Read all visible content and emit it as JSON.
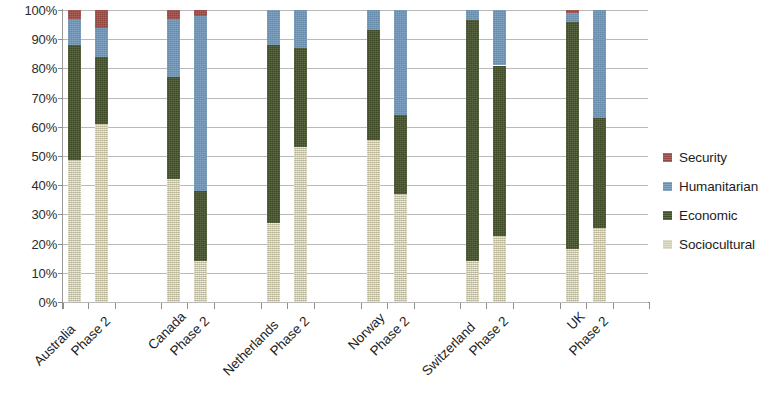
{
  "chart_data": {
    "type": "bar",
    "title": "",
    "subtitle": "",
    "xlabel": "",
    "ylabel": "",
    "stacked": true,
    "stack_mode": "percent",
    "grid": true,
    "legend_position": "right",
    "ylim": [
      0,
      100
    ],
    "ytick_labels": [
      "0%",
      "10%",
      "20%",
      "30%",
      "40%",
      "50%",
      "60%",
      "70%",
      "80%",
      "90%",
      "100%"
    ],
    "ytick_values": [
      0,
      10,
      20,
      30,
      40,
      50,
      60,
      70,
      80,
      90,
      100
    ],
    "categories": [
      "Australia",
      "Phase 2",
      "Canada",
      "Phase 2",
      "Netherlands",
      "Phase 2",
      "Norway",
      "Phase 2",
      "Switzerland",
      "Phase 2",
      "UK",
      "Phase 2"
    ],
    "groups": [
      "Australia",
      "Canada",
      "Netherlands",
      "Norway",
      "Switzerland",
      "UK"
    ],
    "series": [
      {
        "name": "Sociocultural",
        "color": "#d9d8c0",
        "values": [
          48.5,
          61.0,
          42.0,
          14.0,
          27.0,
          53.0,
          55.5,
          37.0,
          14.0,
          22.5,
          18.0,
          25.5
        ]
      },
      {
        "name": "Economic",
        "color": "#44512a",
        "values": [
          39.5,
          23.0,
          35.0,
          24.0,
          61.0,
          34.0,
          37.5,
          27.0,
          82.5,
          58.5,
          78.0,
          37.5
        ]
      },
      {
        "name": "Humanitarian",
        "color": "#7096b8",
        "values": [
          9.0,
          10.0,
          20.0,
          60.0,
          12.0,
          13.0,
          7.0,
          36.0,
          3.5,
          19.0,
          3.0,
          37.0
        ]
      },
      {
        "name": "Security",
        "color": "#9e4b46",
        "values": [
          3.0,
          6.0,
          3.0,
          2.0,
          0.0,
          0.0,
          0.0,
          0.0,
          0.0,
          0.0,
          1.0,
          0.0
        ]
      }
    ]
  },
  "legend": {
    "items": [
      {
        "label": "Security",
        "color": "#9e4b46"
      },
      {
        "label": "Humanitarian",
        "color": "#7096b8"
      },
      {
        "label": "Economic",
        "color": "#44512a"
      },
      {
        "label": "Sociocultural",
        "color": "#d9d8c0"
      }
    ]
  }
}
